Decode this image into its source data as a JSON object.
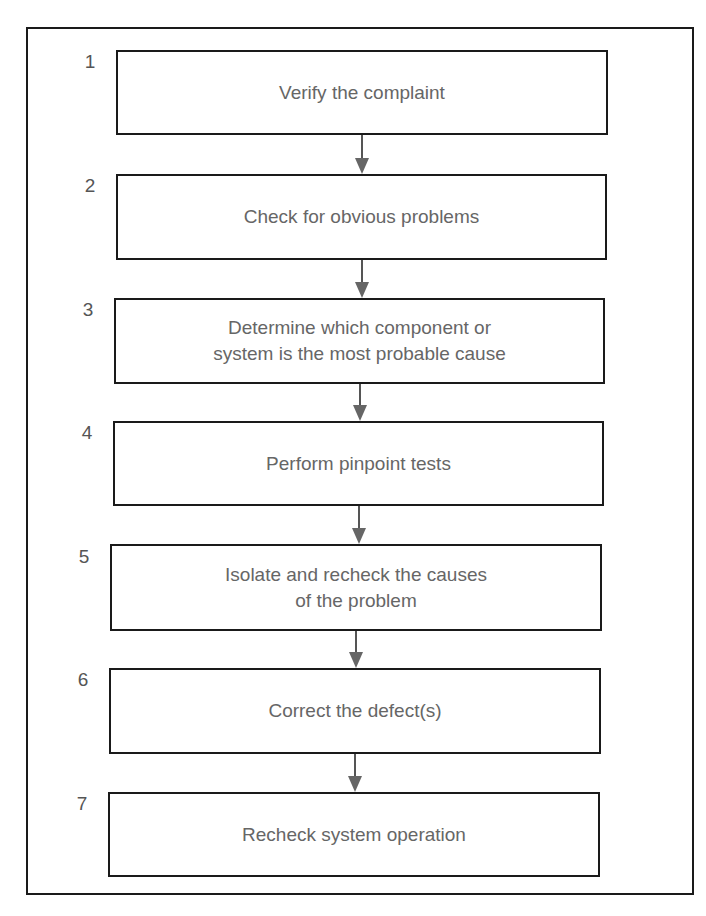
{
  "diagram": {
    "type": "flowchart",
    "steps": [
      {
        "number": "1",
        "label": "Verify the complaint"
      },
      {
        "number": "2",
        "label": "Check for obvious problems"
      },
      {
        "number": "3",
        "label": "Determine which component or\nsystem is the most probable cause"
      },
      {
        "number": "4",
        "label": "Perform pinpoint tests"
      },
      {
        "number": "5",
        "label": "Isolate and recheck the causes\nof the problem"
      },
      {
        "number": "6",
        "label": "Correct the defect(s)"
      },
      {
        "number": "7",
        "label": "Recheck system operation"
      }
    ],
    "colors": {
      "border": "#1a1a1a",
      "text": "#666666",
      "arrow": "#666666"
    }
  }
}
